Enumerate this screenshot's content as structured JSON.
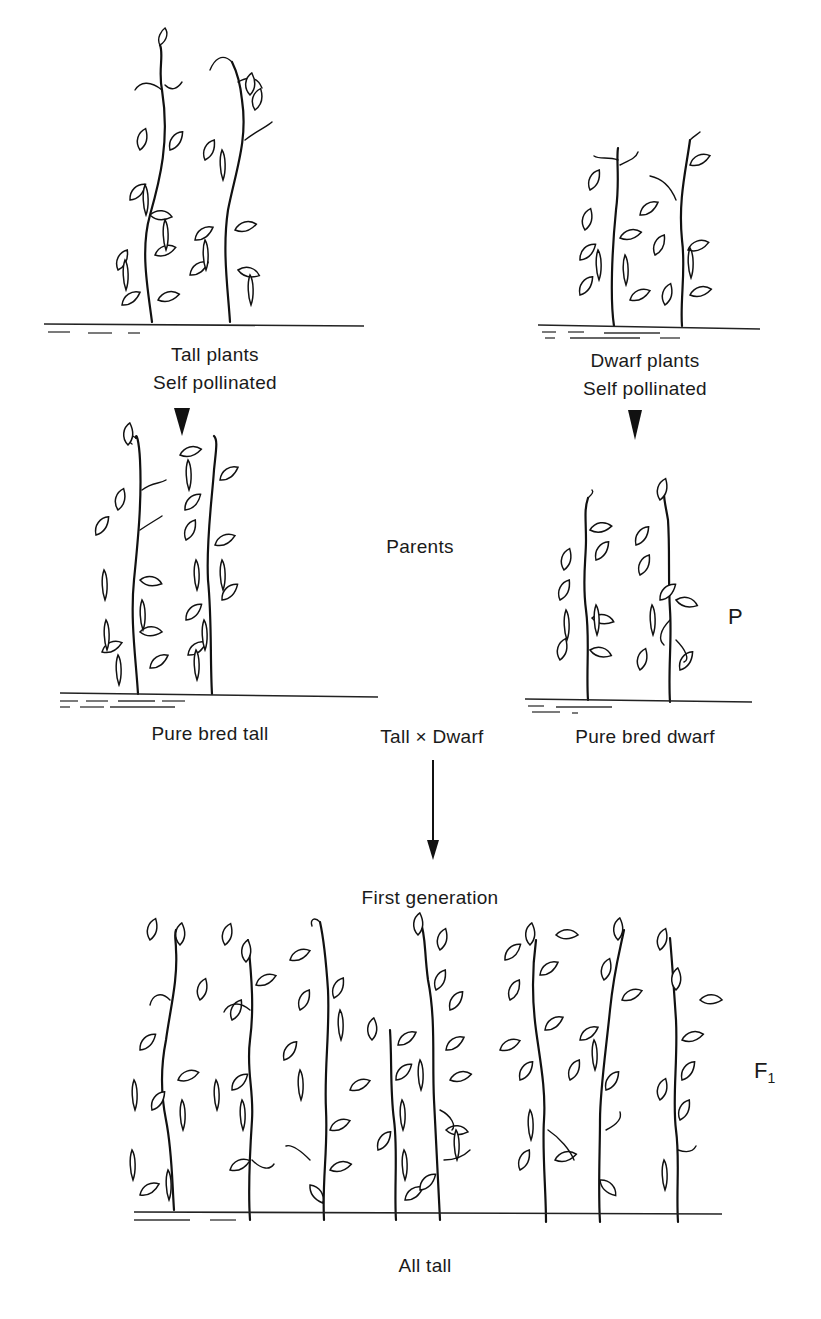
{
  "diagram": {
    "top_left": {
      "line1": "Tall plants",
      "line2": "Self pollinated"
    },
    "top_right": {
      "line1": "Dwarf plants",
      "line2": "Self pollinated"
    },
    "parents_label": "Parents",
    "parent_left_label": "Pure bred tall",
    "parent_right_label": "Pure bred dwarf",
    "cross_label": "Tall × Dwarf",
    "generation_symbol_p": "P",
    "first_generation_label": "First generation",
    "generation_symbol_f": "F",
    "generation_symbol_f_sub": "1",
    "offspring_label": "All tall",
    "plant_counts": {
      "top_tall": 2,
      "top_dwarf": 2,
      "parent_tall": 2,
      "parent_dwarf": 2,
      "f1_tall": 8
    },
    "arrows": [
      "self-pollination tall",
      "self-pollination dwarf",
      "cross to F1"
    ]
  }
}
